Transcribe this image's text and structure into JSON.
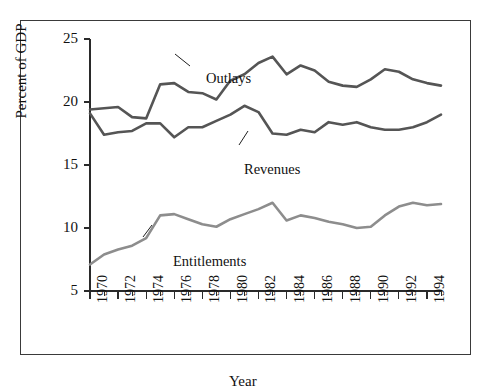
{
  "figure": {
    "background_color": "#ffffff",
    "frame_color": "#3a3a3a"
  },
  "chart_data": {
    "type": "line",
    "title": "",
    "xlabel": "Year",
    "ylabel": "Percent of GDP",
    "xlim": [
      1970,
      1995
    ],
    "ylim": [
      5,
      25
    ],
    "grid": false,
    "legend": "inline-annotations",
    "x": [
      1970,
      1971,
      1972,
      1973,
      1974,
      1975,
      1976,
      1977,
      1978,
      1979,
      1980,
      1981,
      1982,
      1983,
      1984,
      1985,
      1986,
      1987,
      1988,
      1989,
      1990,
      1991,
      1992,
      1993,
      1994,
      1995
    ],
    "xtick_labels": [
      "1970",
      "1972",
      "1974",
      "1976",
      "1978",
      "1980",
      "1982",
      "1984",
      "1986",
      "1988",
      "1990",
      "1992",
      "1994"
    ],
    "xtick_values": [
      1970,
      1972,
      1974,
      1976,
      1978,
      1980,
      1982,
      1984,
      1986,
      1988,
      1990,
      1992,
      1994
    ],
    "ytick_labels": [
      "5",
      "10",
      "15",
      "20",
      "25"
    ],
    "ytick_values": [
      5,
      10,
      15,
      20,
      25
    ],
    "series": [
      {
        "name": "Outlays",
        "color": "#555555",
        "values": [
          19.4,
          19.5,
          19.6,
          18.8,
          18.7,
          21.4,
          21.5,
          20.8,
          20.7,
          20.2,
          21.7,
          22.2,
          23.1,
          23.6,
          22.2,
          22.9,
          22.5,
          21.6,
          21.3,
          21.2,
          21.8,
          22.6,
          22.4,
          21.8,
          21.5,
          21.3
        ]
      },
      {
        "name": "Revenues",
        "color": "#555555",
        "values": [
          19.1,
          17.4,
          17.6,
          17.7,
          18.3,
          18.3,
          17.2,
          18.0,
          18.0,
          18.5,
          19.0,
          19.7,
          19.2,
          17.5,
          17.4,
          17.8,
          17.6,
          18.4,
          18.2,
          18.4,
          18.0,
          17.8,
          17.8,
          18.0,
          18.4,
          19.0
        ]
      },
      {
        "name": "Entitlements",
        "color": "#8d8d8d",
        "values": [
          7.1,
          7.9,
          8.3,
          8.6,
          9.2,
          11.0,
          11.1,
          10.7,
          10.3,
          10.1,
          10.7,
          11.1,
          11.5,
          12.0,
          10.6,
          11.0,
          10.8,
          10.5,
          10.3,
          10.0,
          10.1,
          11.0,
          11.7,
          12.0,
          11.8,
          11.9
        ]
      }
    ],
    "annotations": [
      {
        "name": "outlays-label",
        "text": "Outlays",
        "points_to_year": 1979,
        "points_to_value": 20.4
      },
      {
        "name": "revenues-label",
        "text": "Revenues",
        "points_to_year": 1983,
        "points_to_value": 17.8
      },
      {
        "name": "entitlements-label",
        "text": "Entitlements",
        "points_to_year": 1977,
        "points_to_value": 10.7
      }
    ]
  }
}
